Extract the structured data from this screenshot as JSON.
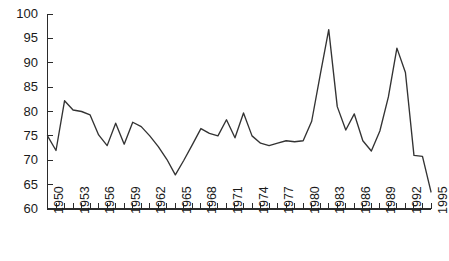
{
  "chart_data": {
    "type": "line",
    "title": "",
    "subtitle": "",
    "xlabel": "",
    "ylabel": "",
    "xlim": [
      1950,
      1995
    ],
    "ylim": [
      60,
      100
    ],
    "grid": false,
    "legend": "none",
    "y_ticks": [
      60,
      65,
      70,
      75,
      80,
      85,
      90,
      95,
      100
    ],
    "y_tick_labels": [
      "60",
      "65",
      "70",
      "75",
      "80",
      "85",
      "90",
      "95",
      "100"
    ],
    "x_tick_labels": [
      "1950",
      "1953",
      "1956",
      "1959",
      "1962",
      "1965",
      "1968",
      "1971",
      "1974",
      "1977",
      "1980",
      "1983",
      "1986",
      "1989",
      "1992",
      "1995"
    ],
    "x_minor_tick_interval": 1,
    "x_label_interval": 3,
    "x": [
      1950,
      1951,
      1952,
      1953,
      1954,
      1955,
      1956,
      1957,
      1958,
      1959,
      1960,
      1961,
      1962,
      1963,
      1964,
      1965,
      1966,
      1967,
      1968,
      1969,
      1970,
      1971,
      1972,
      1973,
      1974,
      1975,
      1976,
      1977,
      1978,
      1979,
      1980,
      1981,
      1982,
      1983,
      1984,
      1985,
      1986,
      1987,
      1988,
      1989,
      1990,
      1991,
      1992,
      1993,
      1994,
      1995
    ],
    "values": [
      75.0,
      72.0,
      82.2,
      80.3,
      80.0,
      79.3,
      75.2,
      73.0,
      77.6,
      73.3,
      77.8,
      76.9,
      75.0,
      72.8,
      70.2,
      67.0,
      70.0,
      73.2,
      76.5,
      75.5,
      75.0,
      78.3,
      74.6,
      79.7,
      75.0,
      73.5,
      73.0,
      73.5,
      74.0,
      73.8,
      74.0,
      78.0,
      87.5,
      96.8,
      81.0,
      76.2,
      79.5,
      74.0,
      71.9,
      76.0,
      83.0,
      93.0,
      88.0,
      71.0,
      70.8,
      63.5
    ],
    "series_color": "#333333",
    "background_color": "#ffffff",
    "axis_color": "#2b2b2b"
  },
  "axis": {
    "y_axis_name": "y-axis",
    "x_axis_name": "x-axis"
  }
}
